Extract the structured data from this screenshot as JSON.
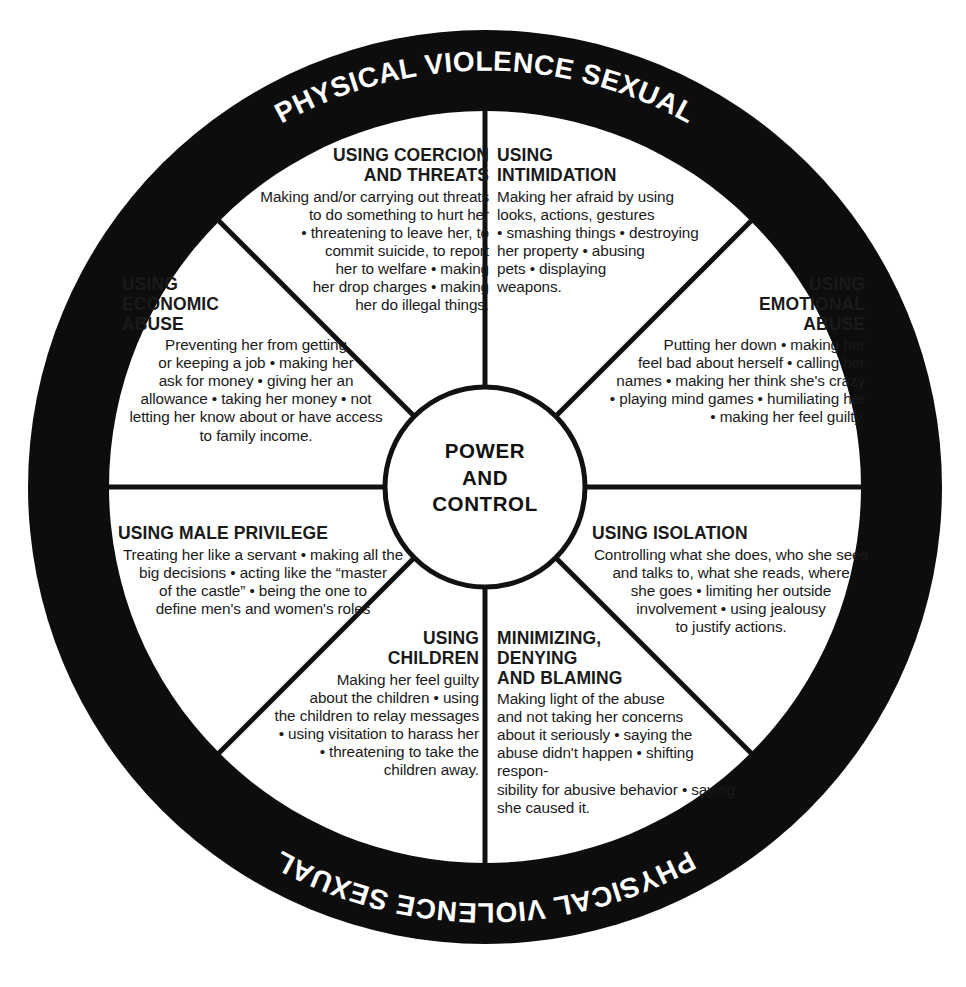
{
  "diagram": {
    "colors": {
      "ring": "#0d0d0d",
      "ring_text": "#ffffff",
      "background": "#ffffff",
      "line": "#111111",
      "text": "#1a1a1a"
    },
    "ring": {
      "top_text": "PHYSICAL VIOLENCE SEXUAL",
      "bottom_text": "PHYSICAL VIOLENCE SEXUAL"
    },
    "hub": {
      "line1": "POWER",
      "line2": "AND",
      "line3": "CONTROL"
    },
    "segments": [
      {
        "id": "coercion",
        "heading": "USING COERCION AND THREATS",
        "heading_lines": [
          "USING COERCION",
          "AND THREATS"
        ],
        "body": "Making and/or carrying out threats to do something to hurt her • threatening to leave her, to commit suicide, to report her to welfare • making her drop charges • making her do illegal things.",
        "body_lines": [
          "Making and/or carrying out threats",
          "to do something to hurt her",
          "• threatening to leave her, to",
          "commit suicide, to report",
          "her to welfare • making",
          "her drop charges • making",
          "her do illegal things."
        ],
        "align": "right"
      },
      {
        "id": "intimidation",
        "heading": "USING INTIMIDATION",
        "heading_lines": [
          "USING",
          "INTIMIDATION"
        ],
        "body": "Making her afraid by using looks, actions, gestures • smashing things • destroying her property • abusing pets • displaying weapons.",
        "body_lines": [
          "Making her afraid by using",
          "looks, actions, gestures",
          "• smashing things • destroying",
          "her property • abusing",
          "pets • displaying",
          "weapons."
        ],
        "align": "left"
      },
      {
        "id": "emotional-abuse",
        "heading": "USING EMOTIONAL ABUSE",
        "heading_lines": [
          "USING",
          "EMOTIONAL",
          "ABUSE"
        ],
        "body": "Putting her down • making her feel bad about herself • calling her names • making her think she's crazy • playing mind games • humiliating her • making her feel guilty.",
        "body_lines": [
          "Putting her down • making her",
          "feel bad about herself • calling her",
          "names • making her think she's crazy",
          "• playing mind games • humiliating her",
          "• making her feel guilty."
        ],
        "align": "right"
      },
      {
        "id": "economic-abuse",
        "heading": "USING ECONOMIC ABUSE",
        "heading_lines": [
          "USING",
          "ECONOMIC",
          "ABUSE"
        ],
        "body": "Preventing her from getting or keeping a job • making her ask for money • giving her an allowance • taking her money • not letting her know about or have access to family income.",
        "body_lines": [
          "Preventing her from getting",
          "or keeping a job • making her",
          "ask for money • giving her an",
          "allowance • taking her money • not",
          "letting her know about or have access",
          "to family income."
        ],
        "align": "left"
      },
      {
        "id": "male-privilege",
        "heading": "USING MALE PRIVILEGE",
        "heading_lines": [
          "USING MALE PRIVILEGE"
        ],
        "body": "Treating her like a servant • making all the big decisions • acting like the \"master of the castle\" • being the one to define men's and women's roles",
        "body_lines": [
          "Treating her like a servant • making all the",
          "big decisions • acting like the “master",
          "of the castle” • being the one to",
          "define men's and women's roles"
        ],
        "align": "left"
      },
      {
        "id": "isolation",
        "heading": "USING ISOLATION",
        "heading_lines": [
          "USING ISOLATION"
        ],
        "body": "Controlling what she does, who she sees and talks to, what she reads, where she goes • limiting her outside involvement • using jealousy to justify actions.",
        "body_lines": [
          "Controlling what she does, who she sees",
          "and talks to, what she reads, where",
          "she goes • limiting her outside",
          "involvement • using jealousy",
          "to justify actions."
        ],
        "align": "left"
      },
      {
        "id": "using-children",
        "heading": "USING CHILDREN",
        "heading_lines": [
          "USING",
          "CHILDREN"
        ],
        "body": "Making her feel guilty about the children • using the children to relay messages • using visitation to harass her • threatening to take the children away.",
        "body_lines": [
          "Making her feel guilty",
          "about the children • using",
          "the children to relay messages",
          "• using visitation to harass her",
          "• threatening to take the",
          "children away."
        ],
        "align": "right"
      },
      {
        "id": "minimizing-denying-blaming",
        "heading": "MINIMIZING, DENYING AND BLAMING",
        "heading_lines": [
          "MINIMIZING,",
          "DENYING",
          "AND BLAMING"
        ],
        "body": "Making light of the abuse and not taking her concerns about it seriously • saying the abuse didn't happen • shifting responsibility for abusive behavior • saying she caused it.",
        "body_lines": [
          "Making light of the abuse",
          "and not taking her concerns",
          "about it seriously • saying the",
          "abuse didn't happen • shifting respon-",
          "sibility for abusive behavior • saying",
          "she caused it."
        ],
        "align": "left"
      }
    ]
  }
}
